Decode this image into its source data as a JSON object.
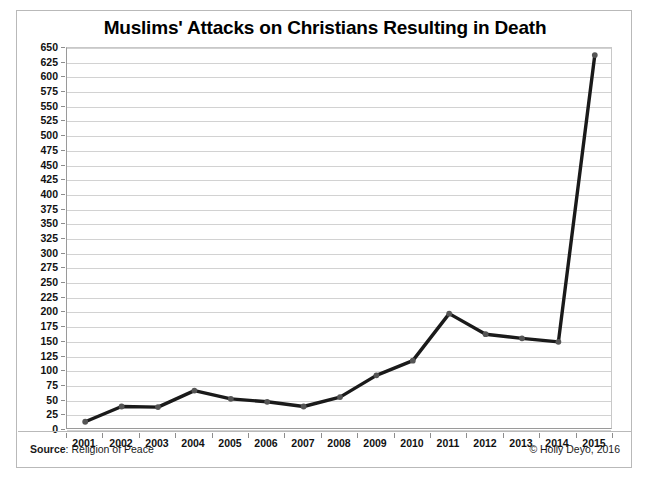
{
  "chart_data": {
    "type": "line",
    "title": "Muslims' Attacks on Christians Resulting in Death",
    "xlabel": "",
    "ylabel": "",
    "categories": [
      "2001",
      "2002",
      "2003",
      "2004",
      "2005",
      "2006",
      "2007",
      "2008",
      "2009",
      "2010",
      "2011",
      "2012",
      "2013",
      "2014",
      "2015"
    ],
    "values": [
      14,
      40,
      39,
      67,
      53,
      48,
      40,
      56,
      93,
      118,
      198,
      163,
      156,
      150,
      638
    ],
    "series": [
      {
        "name": "Attacks resulting in death",
        "values": [
          14,
          40,
          39,
          67,
          53,
          48,
          40,
          56,
          93,
          118,
          198,
          163,
          156,
          150,
          638
        ]
      }
    ],
    "ylim": [
      0,
      650
    ],
    "ytick_step": 25,
    "yticks": [
      0,
      25,
      50,
      75,
      100,
      125,
      150,
      175,
      200,
      225,
      250,
      275,
      300,
      325,
      350,
      375,
      400,
      425,
      450,
      475,
      500,
      525,
      550,
      575,
      600,
      625,
      650
    ],
    "ytick_labels": [
      "0",
      "25",
      "50",
      "75",
      "100",
      "125",
      "150",
      "175",
      "200",
      "225",
      "250",
      "275",
      "300",
      "325",
      "350",
      "375",
      "400",
      "425",
      "450",
      "475",
      "500",
      "525",
      "550",
      "575",
      "600",
      "625",
      "650"
    ],
    "grid": true,
    "legend": false,
    "legend_position": "none",
    "line_color": "#1a1a1a",
    "marker_color": "#555555",
    "grid_color": "#d2d2d2"
  },
  "footer": {
    "source_label": "Source",
    "source_separator": ": ",
    "source_value": "Religion of Peace",
    "copyright": "© Holly Deyo, 2016"
  }
}
